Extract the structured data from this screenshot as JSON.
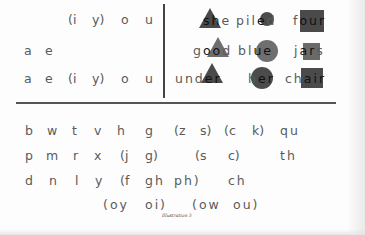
{
  "top_left": {
    "row1": [
      "(i",
      "y)",
      "o",
      "u"
    ],
    "row2": [
      "a",
      "e"
    ],
    "row3": [
      "a",
      "e",
      "(i",
      "y)",
      "o",
      "u"
    ]
  },
  "top_right": {
    "rows": [
      [
        {
          "pre": "",
          "hl": "sh",
          "post": "e",
          "shape": "triangle"
        },
        {
          "pre": "pil",
          "hl": "e",
          "post": "d",
          "shape": "circle"
        },
        {
          "pre": "f",
          "hl": "our",
          "post": "",
          "shape": "square"
        }
      ],
      [
        {
          "pre": "g",
          "hl": "oo",
          "post": "d",
          "shape": "triangle"
        },
        {
          "pre": "bl",
          "hl": "ue",
          "post": "",
          "shape": "circle"
        },
        {
          "pre": "j",
          "hl": "ar",
          "post": "s",
          "shape": "square"
        }
      ],
      [
        {
          "pre": "und",
          "hl": "er",
          "post": "",
          "shape": "triangle"
        },
        {
          "pre": "h",
          "hl": "er",
          "post": "",
          "shape": "circle"
        },
        {
          "pre": "ch",
          "hl": "air",
          "post": "",
          "shape": "square"
        }
      ]
    ]
  },
  "consonants": {
    "row1": [
      "b",
      "w",
      "t",
      "v",
      "h",
      "g",
      "(z",
      "s)",
      "(c",
      "k)",
      "qu"
    ],
    "row2": [
      "p",
      "m",
      "r",
      "x",
      "(j",
      "g)",
      "(s",
      "c)",
      "th"
    ],
    "row3": [
      "d",
      "n",
      "l",
      "y",
      "(f",
      "gh",
      "ph)",
      "ch"
    ],
    "row4": [
      "(oy",
      "oi)",
      "(ow",
      "ou)"
    ]
  },
  "caption": "Illustration 3",
  "colors": {
    "text": "#5a5a5a",
    "highlight_text": "#111111",
    "shape_dark": "#4a4a4a",
    "shape_light": "#6e6e6e",
    "rule": "#555555"
  }
}
